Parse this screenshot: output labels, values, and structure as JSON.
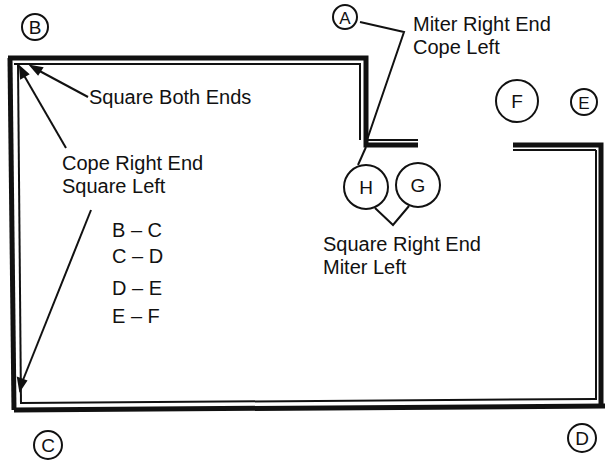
{
  "diagram": {
    "type": "floor-plan-trim-cutting-guide",
    "points": {
      "A": "A",
      "B": "B",
      "C": "C",
      "D": "D",
      "E": "E",
      "F": "F",
      "G": "G",
      "H": "H"
    },
    "annotations": {
      "square_both_ends": "Square Both Ends",
      "cope_right_line1": "Cope Right End",
      "cope_right_line2": "Square Left",
      "miter_right_line1": "Miter Right End",
      "miter_right_line2": "Cope Left",
      "square_right_line1": "Square Right End",
      "square_right_line2": "Miter Left"
    },
    "segments": [
      "B – C",
      "C – D",
      "D – E",
      "E – F"
    ],
    "colors": {
      "ink": "#111111",
      "background": "#ffffff"
    }
  }
}
